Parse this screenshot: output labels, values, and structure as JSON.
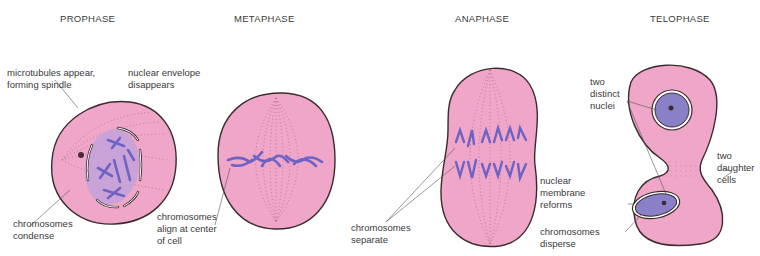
{
  "diagram": {
    "colors": {
      "cytoplasm": "#f0a6c8",
      "outline": "#3b2a2e",
      "chromosome": "#7f72cc",
      "nucleus": "#8a80c8",
      "nucleus_light": "#c6b6de",
      "label_text": "#3a3a3a",
      "leader_line": "#555555"
    },
    "phases": [
      {
        "name": "PROPHASE",
        "labels": [
          "microtubules appear,\nforming spindle",
          "chromosomes\ncondense"
        ]
      },
      {
        "name": "METAPHASE",
        "labels": [
          "nuclear envelope\ndisappears",
          "chromosomes\nalign at center\nof cell"
        ]
      },
      {
        "name": "ANAPHASE",
        "labels": [
          "chromosomes\nseparate"
        ]
      },
      {
        "name": "TELOPHASE",
        "labels": [
          "two\ndistinct\nnuclei",
          "nuclear\nmembrane\nreforms",
          "chromosomes\ndisperse",
          "two\ndaughter\ncells"
        ]
      }
    ]
  }
}
